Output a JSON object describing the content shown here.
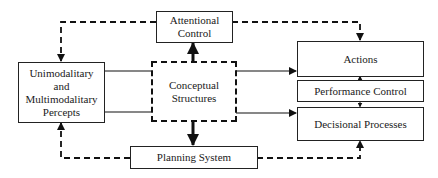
{
  "diagram": {
    "nodes": {
      "attentional_control": {
        "line1": "Attentional",
        "line2": "Control"
      },
      "percepts": {
        "line1": "Unimodalitary",
        "line2": "and",
        "line3": "Multimodalitary",
        "line4": "Percepts"
      },
      "conceptual_structures": {
        "line1": "Conceptual",
        "line2": "Structures",
        "style": "dashed"
      },
      "actions": {
        "label": "Actions"
      },
      "performance_control": {
        "label": "Performance Control"
      },
      "decisional_processes": {
        "label": "Decisional Processes"
      },
      "planning_system": {
        "label": "Planning System"
      }
    },
    "edges": [
      {
        "from": "Attentional Control",
        "to": "Unimodalitary and Multimodalitary Percepts",
        "style": "dashed"
      },
      {
        "from": "Attentional Control",
        "to": "Actions",
        "style": "dashed"
      },
      {
        "from": "Conceptual Structures",
        "to": "Attentional Control",
        "style": "solid-bold"
      },
      {
        "from": "Conceptual Structures",
        "to": "Planning System",
        "style": "solid-bold"
      },
      {
        "from": "Unimodalitary and Multimodalitary Percepts",
        "to": "Conceptual Structures",
        "style": "solid"
      },
      {
        "from": "Conceptual Structures",
        "to": "Actions",
        "style": "solid"
      },
      {
        "from": "Conceptual Structures",
        "to": "Decisional Processes",
        "style": "solid"
      },
      {
        "from": "Planning System",
        "to": "Unimodalitary and Multimodalitary Percepts",
        "style": "dashed"
      },
      {
        "from": "Planning System",
        "to": "Decisional Processes",
        "style": "dashed"
      },
      {
        "from": "Performance Control",
        "to": "Actions",
        "style": "solid-small"
      },
      {
        "from": "Performance Control",
        "to": "Decisional Processes",
        "style": "solid-small"
      }
    ]
  }
}
